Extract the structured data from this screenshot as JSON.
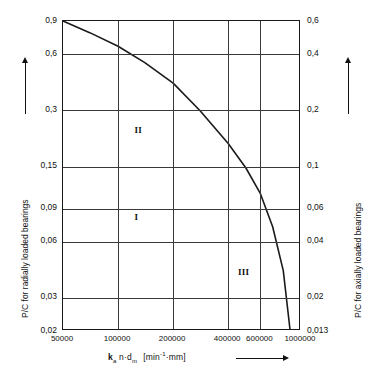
{
  "chart_data": {
    "type": "line",
    "title": "",
    "xlabel": "k_a n d_m  [min^-1 mm]",
    "xlabel_symbol": "k",
    "xlabel_symbol_sub": "a",
    "xlabel_rest": "n·d",
    "xlabel_rest_sub": "m",
    "xlabel_unit_open": "[",
    "xlabel_unit_main": "min",
    "xlabel_unit_sup": "-1",
    "xlabel_unit_tail": "·mm",
    "xlabel_unit_close": "]",
    "ylabel_left": "P/C for radially loaded bearings",
    "ylabel_right": "P/C for axially loaded bearings",
    "xscale": "log",
    "yscale": "log",
    "xlim": [
      50000,
      1000000
    ],
    "ylim_left": [
      0.02,
      0.9
    ],
    "ylim_right": [
      0.013,
      0.6
    ],
    "grid": true,
    "legend": "none",
    "x_ticks": [
      50000,
      100000,
      200000,
      400000,
      600000,
      1000000
    ],
    "x_tick_labels": [
      "50000",
      "100000",
      "200000",
      "400000",
      "600000",
      "1000000"
    ],
    "y_ticks_left": [
      0.9,
      0.6,
      0.3,
      0.15,
      0.09,
      0.06,
      0.03,
      0.02
    ],
    "y_tick_labels_left": [
      "0,9",
      "0,6",
      "0,3",
      "0,15",
      "0,09",
      "0,06",
      "0,03",
      "0,02"
    ],
    "y_ticks_right": [
      0.6,
      0.4,
      0.2,
      0.1,
      0.06,
      0.04,
      0.02,
      0.013
    ],
    "y_tick_labels_right": [
      "0,6",
      "0,4",
      "0,2",
      "0,1",
      "0,06",
      "0,04",
      "0,02",
      "0,013"
    ],
    "series": [
      {
        "name": "boundary-curve",
        "color": "#1a1a1a",
        "x": [
          50000,
          70000,
          100000,
          140000,
          200000,
          280000,
          400000,
          500000,
          600000,
          700000,
          800000,
          870000
        ],
        "y": [
          0.9,
          0.78,
          0.66,
          0.54,
          0.42,
          0.3,
          0.2,
          0.148,
          0.108,
          0.072,
          0.042,
          0.0205
        ]
      }
    ],
    "annotations": [
      {
        "text": "I",
        "x_frac": 0.3,
        "y_frac": 0.615
      },
      {
        "text": "II",
        "x_frac": 0.3,
        "y_frac": 0.335
      },
      {
        "text": "III",
        "x_frac": 0.735,
        "y_frac": 0.795
      }
    ]
  }
}
